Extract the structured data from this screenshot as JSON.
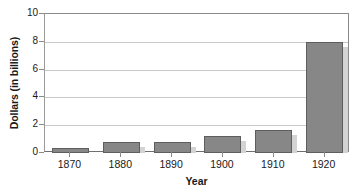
{
  "chart_data": {
    "type": "bar",
    "title": "",
    "xlabel": "Year",
    "ylabel": "Dollars (in billions)",
    "categories": [
      "1870",
      "1880",
      "1890",
      "1900",
      "1910",
      "1920"
    ],
    "values": [
      0.35,
      0.8,
      0.8,
      1.25,
      1.65,
      8.0
    ],
    "series": [
      {
        "name": "Dollars (in billions)",
        "values": [
          0.35,
          0.8,
          0.8,
          1.25,
          1.65,
          8.0
        ]
      }
    ],
    "ylim": [
      0,
      10
    ],
    "yticks": [
      0,
      2,
      4,
      6,
      8,
      10
    ],
    "ytick_labels": [
      "0",
      "2",
      "4",
      "6",
      "8",
      "10"
    ],
    "grid": true,
    "grid_axis": "y",
    "legend": false,
    "legend_position": "none",
    "bar_color": "#878787",
    "bar_edge_color": "#5e5e5e",
    "shadow_color": "#d3d3d3",
    "gridline_color": "#c9c9c9",
    "axis_color": "#8a8a8a",
    "text_color": "#1a1a1a",
    "background": "#ffffff"
  },
  "axes": {
    "y_title": "Dollars (in billions)",
    "x_title": "Year"
  }
}
